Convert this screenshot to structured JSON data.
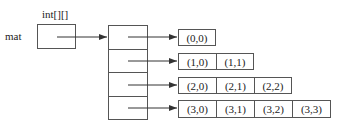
{
  "diagram": {
    "type_label": "int[][]",
    "variable_label": "mat",
    "row_pointer_count": 4,
    "rows": [
      {
        "index": 0,
        "cells": [
          "(0,0)"
        ]
      },
      {
        "index": 1,
        "cells": [
          "(1,0)",
          "(1,1)"
        ]
      },
      {
        "index": 2,
        "cells": [
          "(2,0)",
          "(2,1)",
          "(2,2)"
        ]
      },
      {
        "index": 3,
        "cells": [
          "(3,0)",
          "(3,1)",
          "(3,2)",
          "(3,3)"
        ]
      }
    ],
    "colors": {
      "stroke": "#555555",
      "text": "#222222",
      "background": "#ffffff"
    }
  }
}
